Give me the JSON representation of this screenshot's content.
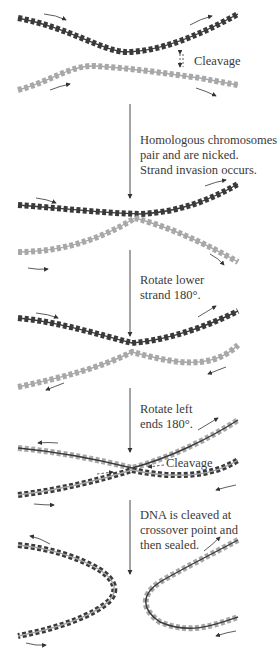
{
  "figure": {
    "type": "holliday-junction recombination steps",
    "colors": {
      "dark_strand": "#3a3a3a",
      "light_strand": "#a8a8a8",
      "arrow": "#333333",
      "text": "#3a3a3a"
    },
    "labels": {
      "cleavage_top": "Cleavage",
      "step1_line1": "Homologous chromosomes",
      "step1_line2": "pair and are nicked.",
      "step1_line3": "Strand invasion occurs.",
      "step2_line1": "Rotate lower",
      "step2_line2": "strand 180°.",
      "step3_line1": "Rotate left",
      "step3_line2": "ends 180°.",
      "cleavage_mid": "Cleavage",
      "step4_line1": "DNA is cleaved at",
      "step4_line2": "crossover point and",
      "step4_line3": "then sealed."
    }
  }
}
